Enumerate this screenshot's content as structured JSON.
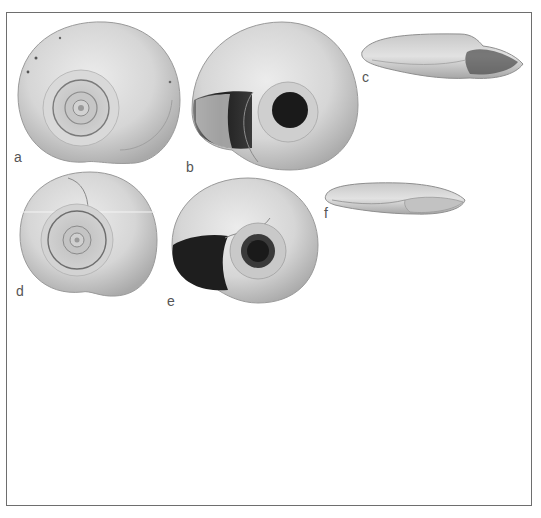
{
  "figure": {
    "panels": [
      {
        "id": "a",
        "label": "a",
        "view": "apical (dorsal) view"
      },
      {
        "id": "b",
        "label": "b",
        "view": "umbilical (ventral) view"
      },
      {
        "id": "c",
        "label": "c",
        "view": "apertural side view"
      },
      {
        "id": "d",
        "label": "d",
        "view": "apical (dorsal) view"
      },
      {
        "id": "e",
        "label": "e",
        "view": "umbilical (ventral) view"
      },
      {
        "id": "f",
        "label": "f",
        "view": "apertural side view"
      }
    ],
    "colors": {
      "border": "#6e6e6e",
      "shell_light": "#dcdcdc",
      "shell_mid": "#b4b4b4",
      "shell_dark": "#2a2a2a",
      "label": "#555555"
    }
  }
}
